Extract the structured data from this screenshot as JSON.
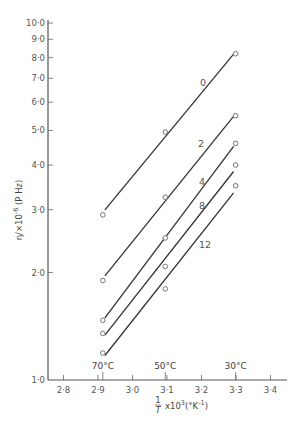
{
  "chart_data": {
    "type": "scatter",
    "title": "",
    "xlabel": "1/T x10^3 (°K^-1)",
    "xlabel_parts": {
      "frac_num": "1",
      "frac_den": "T",
      "rest": "x10",
      "exp": "3",
      "unit_open": "(°K",
      "unit_exp": "-1",
      "unit_close": ")"
    },
    "ylabel": "η/×10^-6 (P Hz)",
    "ylabel_parts": {
      "main": "η/×10",
      "exp": "-6",
      "unit": "(P Hz)"
    },
    "yscale": "log",
    "xlim": [
      2.75,
      3.45
    ],
    "ylim": [
      1.0,
      10.0
    ],
    "grid": false,
    "x_ticks": [
      "2·8",
      "2·9",
      "3·0",
      "3·1",
      "3·2",
      "3·3",
      "3·4"
    ],
    "x_tick_values": [
      2.8,
      2.9,
      3.0,
      3.1,
      3.2,
      3.3,
      3.4
    ],
    "y_ticks": [
      "1·0",
      "2·0",
      "3·0",
      "4·0",
      "5·0",
      "6·0",
      "7·0",
      "8·0",
      "9·0",
      "10·0"
    ],
    "y_tick_values": [
      1,
      2,
      3,
      4,
      5,
      6,
      7,
      8,
      9,
      10
    ],
    "temperature_annotations": [
      {
        "label": "70°C",
        "x": 2.914
      },
      {
        "label": "50°C",
        "x": 3.095
      },
      {
        "label": "30°C",
        "x": 3.299
      }
    ],
    "x": [
      2.914,
      3.095,
      3.299
    ],
    "series": [
      {
        "name": "0",
        "values": [
          2.9,
          4.95,
          8.2
        ]
      },
      {
        "name": "2",
        "values": [
          1.9,
          3.25,
          5.5
        ]
      },
      {
        "name": "4",
        "values": [
          1.47,
          2.5,
          4.6
        ]
      },
      {
        "name": "8",
        "values": [
          1.35,
          2.08,
          4.0
        ]
      },
      {
        "name": "12",
        "values": [
          1.19,
          1.8,
          3.5
        ]
      }
    ],
    "legend": "inline labels beside each line",
    "marker": "open circle",
    "line": "straight fitted line per series"
  }
}
